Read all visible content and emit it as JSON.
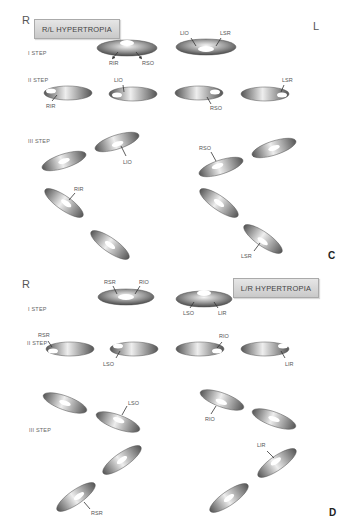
{
  "panel_c": {
    "letter": "C",
    "side_right": "R",
    "side_left": "L",
    "title": "R/L HYPERTROPIA",
    "steps": {
      "step1": {
        "label": "I STEP",
        "eyes": [
          {
            "name": "right-eye",
            "labels": [
              "RIR",
              "RSO"
            ]
          },
          {
            "name": "left-eye",
            "labels": [
              "LIO",
              "LSR"
            ]
          }
        ]
      },
      "step2": {
        "label": "II STEP",
        "eyes": [
          {
            "name": "eye-1",
            "labels": [
              "RIR"
            ]
          },
          {
            "name": "eye-2",
            "labels": [
              "LIO"
            ]
          },
          {
            "name": "eye-3",
            "labels": [
              "RSO"
            ]
          },
          {
            "name": "eye-4",
            "labels": [
              "LSR"
            ]
          }
        ]
      },
      "step3": {
        "label": "III STEP",
        "labels": [
          "LIO",
          "RIR",
          "RSO",
          "LSR"
        ]
      }
    }
  },
  "panel_d": {
    "letter": "D",
    "side_right": "R",
    "title": "L/R HYPERTROPIA",
    "steps": {
      "step1": {
        "label": "I STEP",
        "eyes": [
          {
            "name": "right-eye",
            "labels": [
              "RSR",
              "RIO"
            ]
          },
          {
            "name": "left-eye",
            "labels": [
              "LSO",
              "LIR"
            ]
          }
        ]
      },
      "step2": {
        "label": "II STEP",
        "eyes": [
          {
            "name": "eye-1",
            "labels": [
              "RSR"
            ]
          },
          {
            "name": "eye-2",
            "labels": [
              "LSO"
            ]
          },
          {
            "name": "eye-3",
            "labels": [
              "RIO"
            ]
          },
          {
            "name": "eye-4",
            "labels": [
              "LIR"
            ]
          }
        ]
      },
      "step3": {
        "label": "III STEP",
        "labels": [
          "LSO",
          "RIO",
          "LIR",
          "RSR"
        ]
      }
    }
  },
  "colors": {
    "eye_dark": "#5a5a5a",
    "eye_light": "#e8e8e8",
    "panel_bg": "#d8d8d8",
    "panel_border": "#666666"
  }
}
